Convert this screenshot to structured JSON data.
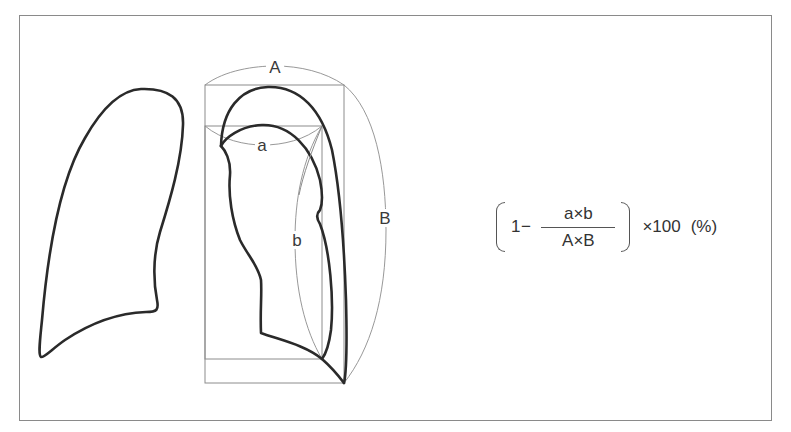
{
  "figure": {
    "labels": {
      "outer_width": "A",
      "outer_height": "B",
      "inner_width": "a",
      "inner_height": "b"
    },
    "formula": {
      "prefix": "1−",
      "numerator": "a×b",
      "denominator": "A×B",
      "multiplier": "×100",
      "unit": "(%)"
    }
  }
}
